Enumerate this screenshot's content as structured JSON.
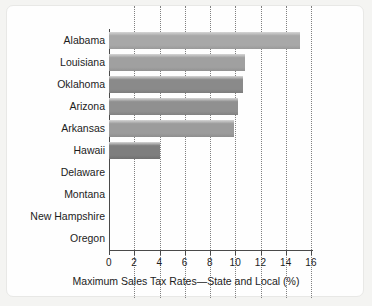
{
  "chart_data": {
    "type": "bar",
    "orientation": "horizontal",
    "title": "",
    "xlabel": "Maximum Sales Tax Rates—State and Local (%)",
    "ylabel": "",
    "xlim": [
      0,
      16
    ],
    "xticks": [
      0,
      2,
      4,
      6,
      8,
      10,
      12,
      14,
      16
    ],
    "xtick_labels": [
      "0",
      "2",
      "4",
      "6",
      "8",
      "10",
      "12",
      "14",
      "16"
    ],
    "grid": "vertical-dotted",
    "legend": "none",
    "categories": [
      "Alabama",
      "Louisiana",
      "Oklahoma",
      "Arizona",
      "Arkansas",
      "Hawaii",
      "Delaware",
      "Montana",
      "New Hampshire",
      "Oregon"
    ],
    "values": [
      15.1,
      10.8,
      10.6,
      10.2,
      9.9,
      4.0,
      0,
      0,
      0,
      0
    ],
    "bar_colors": [
      "#a8a8a8",
      "#a0a0a0",
      "#8a8a8a",
      "#909090",
      "#9c9c9c",
      "#7e7e7e",
      "#9a9a9a",
      "#9a9a9a",
      "#9a9a9a",
      "#9a9a9a"
    ]
  },
  "style": {
    "page_background": "#f4f4f2",
    "card_background": "#fefefe",
    "axis_color": "#4a4a4a",
    "grid_color": "#808080",
    "text_color": "#1c1c1c"
  }
}
